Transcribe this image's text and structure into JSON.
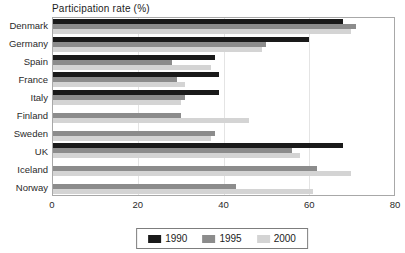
{
  "title": "Participation rate (%)",
  "colors": {
    "series_1990": "#1a1a1a",
    "series_1995": "#8c8c8c",
    "series_2000": "#d4d4d4",
    "plot_border": "#a8a8a8",
    "gridline": "#e4e4e4",
    "text": "#262626"
  },
  "chart_data": {
    "type": "bar",
    "orientation": "horizontal",
    "title": "Participation rate (%)",
    "categories": [
      "Denmark",
      "Germany",
      "Spain",
      "France",
      "Italy",
      "Finland",
      "Sweden",
      "UK",
      "Iceland",
      "Norway"
    ],
    "series": [
      {
        "name": "1990",
        "color": "#1a1a1a",
        "values": [
          68,
          60,
          38,
          39,
          39,
          null,
          null,
          68,
          null,
          null
        ]
      },
      {
        "name": "1995",
        "color": "#8c8c8c",
        "values": [
          71,
          50,
          28,
          29,
          31,
          30,
          38,
          56,
          62,
          43
        ]
      },
      {
        "name": "2000",
        "color": "#d4d4d4",
        "values": [
          70,
          49,
          37,
          31,
          30,
          46,
          37,
          58,
          70,
          61
        ]
      }
    ],
    "xlabel": "",
    "ylabel": "",
    "xlim": [
      0,
      80
    ],
    "x_ticks": [
      0,
      20,
      40,
      60,
      80
    ],
    "grid": true,
    "legend_position": "bottom"
  }
}
